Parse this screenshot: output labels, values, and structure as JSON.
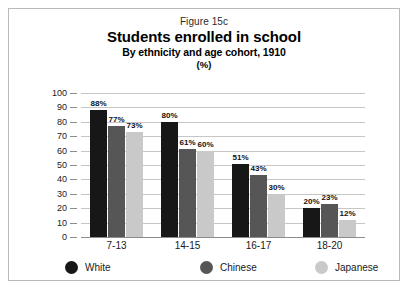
{
  "figure": {
    "number": "Figure 15c",
    "title": "Students enrolled in school",
    "subtitle": "By ethnicity and age cohort, 1910",
    "units": "(%)"
  },
  "colors": {
    "white_series": "#171717",
    "chinese_series": "#565656",
    "japanese_series": "#c9c9c9",
    "gridline": "#c6c6c6",
    "frame": "#b9b9b9",
    "background": "#ffffff"
  },
  "chart_data": {
    "type": "bar",
    "title": "Students enrolled in school",
    "subtitle": "By ethnicity and age cohort, 1910",
    "xlabel": "",
    "ylabel": "",
    "units": "(%)",
    "ylim": [
      0,
      100
    ],
    "ytick_step": 10,
    "yticks": [
      "100",
      "90",
      "80",
      "70",
      "60",
      "50",
      "40",
      "30",
      "20",
      "10",
      "0"
    ],
    "grid": true,
    "legend_position": "bottom",
    "categories": [
      "7-13",
      "14-15",
      "16-17",
      "18-20"
    ],
    "series": [
      {
        "name": "White",
        "color": "#171717",
        "values": [
          88,
          80,
          51,
          20
        ],
        "labels": [
          "88%",
          "80%",
          "51%",
          "20%"
        ]
      },
      {
        "name": "Chinese",
        "color": "#565656",
        "values": [
          77,
          61,
          43,
          23
        ],
        "labels": [
          "77%",
          "61%",
          "43%",
          "23%"
        ]
      },
      {
        "name": "Japanese",
        "color": "#c9c9c9",
        "values": [
          73,
          60,
          30,
          12
        ],
        "labels": [
          "73%",
          "60%",
          "30%",
          "12%"
        ]
      }
    ]
  }
}
